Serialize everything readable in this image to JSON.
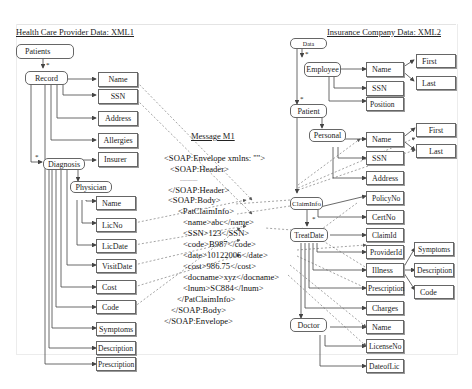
{
  "left_panel": {
    "title": "Health Care Provider Data: XML1",
    "nodes": {
      "patients": "Patients",
      "record": "Record",
      "name": "Name",
      "ssn": "SSN",
      "address": "Address",
      "allergies": "Allergies",
      "insurer": "Insurer",
      "diagnosis": "Diagnosis",
      "physician": "Physician",
      "phys_name": "Name",
      "licno": "LicNo",
      "licdate": "LicDate",
      "visitdate": "VisitDate",
      "cost": "Cost",
      "code": "Code",
      "symptoms": "Symptoms",
      "description": "Description",
      "prescription": "Prescription"
    },
    "multiplicity": "*"
  },
  "message": {
    "title": "Message M1",
    "lines": [
      "<SOAP:Envelope xmlns: \"\">",
      "<SOAP:Header>",
      "..............",
      "</SOAP:Header>",
      "<SOAP:Body>",
      "<PatClaimInfo>",
      "<name>abc</name>",
      "<SSN>123</SSN>",
      "<code>B987</code>",
      "<date>10122006</date>",
      "<cost>986.75</cost>",
      "<docname>xyz</docname>",
      "<lnum>SC884</lnum>",
      "</PatClaimInfo>",
      "</SOAP:Body>",
      "</SOAP:Envelope>"
    ]
  },
  "right_panel": {
    "title": "Insurance Company Data: XML2",
    "nodes": {
      "data": "Data",
      "employee": "Employee",
      "emp_name": "Name",
      "emp_first": "First",
      "emp_last": "Last",
      "emp_ssn": "SSN",
      "position": "Position",
      "patient": "Patient",
      "personal": "Personal",
      "p_name": "Name",
      "p_first": "First",
      "p_last": "Last",
      "p_ssn": "SSN",
      "p_address": "Address",
      "claiminfo": "ClaimInfo",
      "policyno": "PolicyNo",
      "certno": "CertNo",
      "treatdate": "TreatDate",
      "claimid": "ClaimId",
      "providerid": "ProviderId",
      "illness": "Illness",
      "ill_symptoms": "Symptoms",
      "ill_description": "Description",
      "ill_code": "Code",
      "prescription": "Prescription",
      "charges": "Charges",
      "doctor": "Doctor",
      "doc_name": "Name",
      "licenseno": "LicenseNo",
      "dateoflic": "DateofLic"
    },
    "multiplicity": "*"
  },
  "colors": {
    "line": "#444444",
    "dashed": "#666666",
    "frame": "#e4e4e4"
  }
}
